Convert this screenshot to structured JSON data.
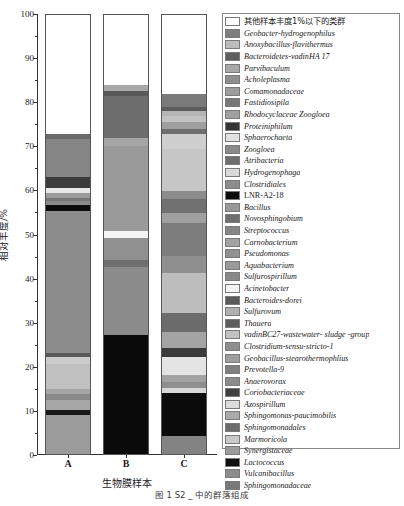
{
  "figure": {
    "caption": "图 1  S2   _ 中的群落组成"
  },
  "axes": {
    "ylabel": "相对丰度/%",
    "xlabel": "生物膜样本",
    "yticks": [
      0,
      10,
      20,
      30,
      40,
      50,
      60,
      70,
      80,
      90,
      100
    ],
    "ylim": [
      0,
      100
    ],
    "xticklabels": [
      "A",
      "B",
      "C"
    ]
  },
  "chart_data": {
    "type": "bar",
    "subtype": "stacked-bar",
    "title": "",
    "xlabel": "生物膜样本",
    "ylabel": "相对丰度/%",
    "ylim": [
      0,
      100
    ],
    "grid": false,
    "legend_position": "right",
    "categories": [
      "A",
      "B",
      "C"
    ],
    "series": [
      {
        "name": "其他样本丰度1%以下的类群",
        "color": "#ffffff",
        "values": [
          27.2,
          16.0,
          18.0
        ]
      },
      {
        "name": "Geobacter-hydrogenophilus",
        "color": "#7d7d7d",
        "values": [
          0.6,
          1.4,
          3.2
        ]
      },
      {
        "name": "Anoxybacillus-flavithermus",
        "color": "#b9b9b9",
        "values": [
          0.0,
          0.0,
          0.8
        ]
      },
      {
        "name": "Bacteroidetes-vadinHA 17",
        "color": "#636363",
        "values": [
          9.4,
          9.6,
          2.4
        ]
      },
      {
        "name": "Parvibaculum",
        "color": "#a8a8a8",
        "values": [
          0.0,
          0.0,
          1.6
        ]
      },
      {
        "name": "Acholeplasma",
        "color": "#8f8f8f",
        "values": [
          0.0,
          0.0,
          1.0
        ]
      },
      {
        "name": "Comamonadaceae",
        "color": "#9d9d9d",
        "values": [
          0.0,
          0.0,
          1.4
        ]
      },
      {
        "name": "Fastidiosipila",
        "color": "#7a7a7a",
        "values": [
          0.0,
          0.0,
          1.2
        ]
      },
      {
        "name": "Rhodocyclaceae Zoogloea",
        "color": "#a0a0a0",
        "values": [
          0.0,
          0.0,
          0.9
        ]
      },
      {
        "name": "Proteiniphilum",
        "color": "#3c3c3c",
        "values": [
          2.6,
          0.0,
          0.0
        ]
      },
      {
        "name": "Sphaerochaeta",
        "color": "#e6e6e6",
        "values": [
          1.2,
          0.0,
          0.0
        ]
      },
      {
        "name": "Zoogloea",
        "color": "#8a8a8a",
        "values": [
          0.8,
          0.0,
          0.0
        ]
      },
      {
        "name": "Atribacteria",
        "color": "#6e6e6e",
        "values": [
          1.0,
          1.0,
          9.6
        ]
      },
      {
        "name": "Hydrogenophaga",
        "color": "#d5d5d5",
        "values": [
          0.0,
          0.0,
          0.0
        ]
      },
      {
        "name": "Clostridiales",
        "color": "#8c8c8c",
        "values": [
          1.0,
          0.0,
          2.0
        ]
      },
      {
        "name": "LNR-A2-18",
        "color": "#0d0d0d",
        "values": [
          1.3,
          0.0,
          0.0
        ]
      },
      {
        "name": "Bacillus",
        "color": "#999999",
        "values": [
          12.0,
          0.0,
          1.6
        ]
      },
      {
        "name": "Novosphingobium",
        "color": "#747474",
        "values": [
          0.0,
          0.0,
          0.0
        ]
      },
      {
        "name": "Streptococcus",
        "color": "#868686",
        "values": [
          0.0,
          0.0,
          0.0
        ]
      },
      {
        "name": "Carnobacterium",
        "color": "#a3a3a3",
        "values": [
          0.0,
          0.0,
          0.0
        ]
      },
      {
        "name": "Pseudomonas",
        "color": "#919191",
        "values": [
          0.0,
          0.0,
          0.0
        ]
      },
      {
        "name": "Aquabacterium",
        "color": "#9a9a9a",
        "values": [
          0.0,
          0.0,
          0.0
        ]
      },
      {
        "name": "Sulfurospirillum",
        "color": "#888888",
        "values": [
          0.0,
          0.0,
          0.0
        ]
      },
      {
        "name": "Acinetobacter",
        "color": "#f2f2f2",
        "values": [
          0.0,
          1.2,
          0.0
        ]
      },
      {
        "name": "Bacteroides-dorei",
        "color": "#6a6a6a",
        "values": [
          0.0,
          0.0,
          0.0
        ]
      },
      {
        "name": "Sulfurovum",
        "color": "#b0b0b0",
        "values": [
          0.0,
          0.0,
          0.0
        ]
      },
      {
        "name": "Thauera",
        "color": "#5e5e5e",
        "values": [
          0.0,
          1.6,
          0.0
        ]
      },
      {
        "name": "vadinBC27-wastewater- sludge -group",
        "color": "#c2c2c2",
        "values": [
          0.0,
          0.0,
          0.0
        ]
      },
      {
        "name": "Clostridium-sensu-stricto-1",
        "color": "#8e8e8e",
        "values": [
          0.0,
          20.0,
          7.6
        ]
      },
      {
        "name": "Geobacillus-stearothermophlius",
        "color": "#9e9e9e",
        "values": [
          0.0,
          0.0,
          0.0
        ]
      },
      {
        "name": "Prevotella-9",
        "color": "#7f7f7f",
        "values": [
          0.0,
          0.0,
          0.0
        ]
      },
      {
        "name": "Anaerovorax",
        "color": "#8b8b8b",
        "values": [
          0.0,
          0.0,
          0.0
        ]
      },
      {
        "name": "Coriobacteriaceae",
        "color": "#4a4a4a",
        "values": [
          0.8,
          0.0,
          3.0
        ]
      },
      {
        "name": "Azospirillum",
        "color": "#dcdcdc",
        "values": [
          0.0,
          0.0,
          0.0
        ]
      },
      {
        "name": "Sphingomonas-paucimobilis",
        "color": "#aaaaaa",
        "values": [
          7.8,
          0.0,
          10.0
        ]
      },
      {
        "name": "Sphingomonadales",
        "color": "#707070",
        "values": [
          1.0,
          0.0,
          3.2
        ]
      },
      {
        "name": "Marmoricola",
        "color": "#cacaca",
        "values": [
          2.0,
          0.0,
          4.8
        ]
      },
      {
        "name": "Synergistaceae",
        "color": "#9c9c9c",
        "values": [
          0.0,
          0.0,
          1.4
        ]
      },
      {
        "name": "Lactococcus",
        "color": "#111111",
        "values": [
          0.9,
          0.0,
          0.0
        ]
      },
      {
        "name": "Vulcanibacillus",
        "color": "#8d8d8d",
        "values": [
          0.0,
          0.0,
          0.0
        ]
      },
      {
        "name": "Sphingomonadaceae",
        "color": "#787878",
        "values": [
          0.0,
          0.0,
          0.0
        ]
      }
    ],
    "stacks": {
      "A": [
        {
          "label": "Sphingomonadaceae",
          "value": 9.0,
          "color": "#9b9b9b",
          "from": 0.0,
          "to": 9.0
        },
        {
          "label": "Lactococcus",
          "value": 1.0,
          "color": "#181818",
          "from": 9.0,
          "to": 10.0
        },
        {
          "label": "Synergistaceae",
          "value": 2.4,
          "color": "#a6a6a6",
          "from": 10.0,
          "to": 12.4
        },
        {
          "label": "Marmoricola",
          "value": 1.3,
          "color": "#8a8a8a",
          "from": 12.4,
          "to": 13.7
        },
        {
          "label": "Sphingomonadales",
          "value": 1.1,
          "color": "#a6a6a6",
          "from": 13.7,
          "to": 14.8
        },
        {
          "label": "Sphingomonas-paucimobilis",
          "value": 5.6,
          "color": "#c0c0c0",
          "from": 14.8,
          "to": 20.4
        },
        {
          "label": "Azospirillum",
          "value": 1.8,
          "color": "#cccccc",
          "from": 20.4,
          "to": 22.2
        },
        {
          "label": "Coriobacteriaceae",
          "value": 0.7,
          "color": "#5a5a5a",
          "from": 22.2,
          "to": 22.9
        },
        {
          "label": "Anaerovorax",
          "value": 22.1,
          "color": "#8d8d8d",
          "from": 22.9,
          "to": 45.0
        },
        {
          "label": "Prevotella-9",
          "value": 10.3,
          "color": "#8d8d8d",
          "from": 45.0,
          "to": 55.3
        },
        {
          "label": "LNR-A2-18",
          "value": 1.4,
          "color": "#0d0d0d",
          "from": 55.3,
          "to": 56.7
        },
        {
          "label": "Clostridiales",
          "value": 1.0,
          "color": "#8c8c8c",
          "from": 56.7,
          "to": 57.7
        },
        {
          "label": "Hydrogenophaga",
          "value": 0.7,
          "color": "#777777",
          "from": 57.7,
          "to": 58.4
        },
        {
          "label": "Atribacteria",
          "value": 1.0,
          "color": "#9a9a9a",
          "from": 58.4,
          "to": 59.4
        },
        {
          "label": "Sphaerochaeta",
          "value": 1.2,
          "color": "#e8e8e8",
          "from": 59.4,
          "to": 60.6
        },
        {
          "label": "Proteiniphilum",
          "value": 2.6,
          "color": "#3c3c3c",
          "from": 60.6,
          "to": 63.2
        },
        {
          "label": "Bacteroidetes-vadinHA 17",
          "value": 8.6,
          "color": "#858585",
          "from": 63.2,
          "to": 71.8
        },
        {
          "label": "Geobacter-hydrogenophilus",
          "value": 1.0,
          "color": "#6b6b6b",
          "from": 71.8,
          "to": 72.8
        },
        {
          "label": "其他样本丰度1%以下的类群",
          "value": 27.2,
          "color": "#ffffff",
          "from": 72.8,
          "to": 100.0
        }
      ],
      "B": [
        {
          "label": "Clostridium-sensu-stricto-1",
          "value": 27.0,
          "color": "#0a0a0a",
          "from": 0.0,
          "to": 27.0
        },
        {
          "label": "Anaerovorax",
          "value": 15.5,
          "color": "#8b8b8b",
          "from": 27.0,
          "to": 42.5
        },
        {
          "label": "Thauera",
          "value": 1.6,
          "color": "#6f6f6f",
          "from": 42.5,
          "to": 44.1
        },
        {
          "label": "Bacteroides-dorei",
          "value": 5.1,
          "color": "#909090",
          "from": 44.1,
          "to": 49.2
        },
        {
          "label": "Acinetobacter",
          "value": 1.6,
          "color": "#f4f4f4",
          "from": 49.2,
          "to": 50.8
        },
        {
          "label": "Aquabacterium",
          "value": 19.4,
          "color": "#9a9a9a",
          "from": 50.8,
          "to": 70.2
        },
        {
          "label": "Sulfurovum",
          "value": 1.8,
          "color": "#a6a6a6",
          "from": 70.2,
          "to": 72.0
        },
        {
          "label": "Bacteroidetes-vadinHA 17",
          "value": 9.6,
          "color": "#6d6d6d",
          "from": 72.0,
          "to": 81.6
        },
        {
          "label": "Geobacter-hydrogenophilus",
          "value": 1.0,
          "color": "#595959",
          "from": 81.6,
          "to": 82.6
        },
        {
          "label": "Anoxybacillus-flavithermus",
          "value": 1.4,
          "color": "#a9a9a9",
          "from": 82.6,
          "to": 84.0
        },
        {
          "label": "其他样本丰度1%以下的类群",
          "value": 16.0,
          "color": "#ffffff",
          "from": 84.0,
          "to": 100.0
        }
      ],
      "C": [
        {
          "label": "Lactococcus",
          "value": 4.0,
          "color": "#838383",
          "from": 0.0,
          "to": 4.0
        },
        {
          "label": "Vulcanibacillus",
          "value": 9.8,
          "color": "#0b0b0b",
          "from": 4.0,
          "to": 13.8
        },
        {
          "label": "Synergistaceae",
          "value": 1.2,
          "color": "#d8d8d8",
          "from": 13.8,
          "to": 15.0
        },
        {
          "label": "Marmoricola",
          "value": 1.4,
          "color": "#8f8f8f",
          "from": 15.0,
          "to": 16.4
        },
        {
          "label": "Sphingomonadales",
          "value": 1.6,
          "color": "#a2a2a2",
          "from": 16.4,
          "to": 18.0
        },
        {
          "label": "Sphingomonas-paucimobilis",
          "value": 4.0,
          "color": "#e4e4e4",
          "from": 18.0,
          "to": 22.0
        },
        {
          "label": "Azospirillum",
          "value": 2.2,
          "color": "#3b3b3b",
          "from": 22.0,
          "to": 24.2
        },
        {
          "label": "Coriobacteriaceae",
          "value": 3.6,
          "color": "#a4a4a4",
          "from": 24.2,
          "to": 27.8
        },
        {
          "label": "Anaerovorax",
          "value": 4.4,
          "color": "#6c6c6c",
          "from": 27.8,
          "to": 32.2
        },
        {
          "label": "Prevotella-9",
          "value": 9.0,
          "color": "#bdbdbd",
          "from": 32.2,
          "to": 41.2
        },
        {
          "label": "Geobacillus-stearothermophlius",
          "value": 4.0,
          "color": "#8f8f8f",
          "from": 41.2,
          "to": 45.2
        },
        {
          "label": "Clostridium-sensu-stricto-1",
          "value": 7.4,
          "color": "#7d7d7d",
          "from": 45.2,
          "to": 52.6
        },
        {
          "label": "vadinBC27-wastewater- sludge -group",
          "value": 2.4,
          "color": "#a0a0a0",
          "from": 52.6,
          "to": 55.0
        },
        {
          "label": "Thauera",
          "value": 3.0,
          "color": "#717171",
          "from": 55.0,
          "to": 58.0
        },
        {
          "label": "Sulfurovum",
          "value": 2.0,
          "color": "#8c8c8c",
          "from": 58.0,
          "to": 60.0
        },
        {
          "label": "Bacteroides-dorei",
          "value": 9.4,
          "color": "#c6c6c6",
          "from": 60.0,
          "to": 69.4
        },
        {
          "label": "Acinetobacter",
          "value": 3.4,
          "color": "#cfcfcf",
          "from": 69.4,
          "to": 72.8
        },
        {
          "label": "Sulfurospirillum",
          "value": 1.3,
          "color": "#6f6f6f",
          "from": 72.8,
          "to": 74.1
        },
        {
          "label": "Aquabacterium",
          "value": 1.6,
          "color": "#9e9e9e",
          "from": 74.1,
          "to": 75.7
        },
        {
          "label": "Pseudomonas",
          "value": 1.4,
          "color": "#c2c2c2",
          "from": 75.7,
          "to": 77.1
        },
        {
          "label": "Carnobacterium",
          "value": 1.0,
          "color": "#b5b5b5",
          "from": 77.1,
          "to": 78.1
        },
        {
          "label": "Streptococcus",
          "value": 1.0,
          "color": "#5c5c5c",
          "from": 78.1,
          "to": 79.1
        },
        {
          "label": "Novosphingobium",
          "value": 2.9,
          "color": "#7a7a7a",
          "from": 79.1,
          "to": 82.0
        },
        {
          "label": "其他样本丰度1%以下的类群",
          "value": 18.0,
          "color": "#ffffff",
          "from": 82.0,
          "to": 100.0
        }
      ]
    }
  },
  "legend": {
    "items": [
      {
        "label": "其他样本丰度1%以下的类群",
        "color": "#ffffff",
        "cjk": true
      },
      {
        "label": "Geobacter-hydrogenophilus",
        "color": "#7d7d7d",
        "cjk": false
      },
      {
        "label": "Anoxybacillus-flavithermus",
        "color": "#bcbcbc",
        "cjk": false
      },
      {
        "label": "Bacteroidetes-vadinHA 17",
        "color": "#5f5f5f",
        "cjk": false
      },
      {
        "label": "Parvibaculum",
        "color": "#a8a8a8",
        "cjk": false
      },
      {
        "label": "Acholeplasma",
        "color": "#8f8f8f",
        "cjk": false
      },
      {
        "label": "Comamonadaceae",
        "color": "#9d9d9d",
        "cjk": false
      },
      {
        "label": "Fastidiosipila",
        "color": "#787878",
        "cjk": false
      },
      {
        "label": "Rhodocyclaceae Zoogloea",
        "color": "#a0a0a0",
        "cjk": false
      },
      {
        "label": "Proteiniphilum",
        "color": "#343434",
        "cjk": false
      },
      {
        "label": "Sphaerochaeta",
        "color": "#e2e2e2",
        "cjk": false
      },
      {
        "label": "Zoogloea",
        "color": "#8a8a8a",
        "cjk": false
      },
      {
        "label": "Atribacteria",
        "color": "#6e6e6e",
        "cjk": false
      },
      {
        "label": "Hydrogenophaga",
        "color": "#d9d9d9",
        "cjk": false
      },
      {
        "label": "Clostridiales",
        "color": "#8c8c8c",
        "cjk": false
      },
      {
        "label": "LNR-A2-18",
        "color": "#0d0d0d",
        "cjk": false,
        "roman": true
      },
      {
        "label": "Bacillus",
        "color": "#999999",
        "cjk": false
      },
      {
        "label": "Novosphingobium",
        "color": "#6f6f6f",
        "cjk": false
      },
      {
        "label": "Streptococcus",
        "color": "#868686",
        "cjk": false
      },
      {
        "label": "Carnobacterium",
        "color": "#a3a3a3",
        "cjk": false
      },
      {
        "label": "Pseudomonas",
        "color": "#919191",
        "cjk": false
      },
      {
        "label": "Aquabacterium",
        "color": "#9a9a9a",
        "cjk": false
      },
      {
        "label": "Sulfurospirillum",
        "color": "#888888",
        "cjk": false
      },
      {
        "label": "Acinetobacter",
        "color": "#f4f4f4",
        "cjk": false
      },
      {
        "label": "Bacteroides-dorei",
        "color": "#5a5a5a",
        "cjk": false
      },
      {
        "label": "Sulfurovum",
        "color": "#b0b0b0",
        "cjk": false
      },
      {
        "label": "Thauera",
        "color": "#5e5e5e",
        "cjk": false
      },
      {
        "label": "vadinBC27-wastewater- sludge -group",
        "color": "#c2c2c2",
        "cjk": false
      },
      {
        "label": "Clostridium-sensu-stricto-1",
        "color": "#8e8e8e",
        "cjk": false
      },
      {
        "label": "Geobacillus-stearothermophlius",
        "color": "#9e9e9e",
        "cjk": false
      },
      {
        "label": "Prevotella-9",
        "color": "#7f7f7f",
        "cjk": false
      },
      {
        "label": "Anaerovorax",
        "color": "#8b8b8b",
        "cjk": false
      },
      {
        "label": "Coriobacteriaceae",
        "color": "#3f3f3f",
        "cjk": false
      },
      {
        "label": "Azospirillum",
        "color": "#dcdcdc",
        "cjk": false
      },
      {
        "label": "Sphingomonas-paucimobilis",
        "color": "#aaaaaa",
        "cjk": false
      },
      {
        "label": "Sphingomonadales",
        "color": "#6b6b6b",
        "cjk": false
      },
      {
        "label": "Marmoricola",
        "color": "#cacaca",
        "cjk": false
      },
      {
        "label": "Synergistaceae",
        "color": "#9c9c9c",
        "cjk": false
      },
      {
        "label": "Lactococcus",
        "color": "#0f0f0f",
        "cjk": false
      },
      {
        "label": "Vulcanibacillus",
        "color": "#8d8d8d",
        "cjk": false
      },
      {
        "label": "Sphingomonadaceae",
        "color": "#787878",
        "cjk": false
      }
    ]
  }
}
